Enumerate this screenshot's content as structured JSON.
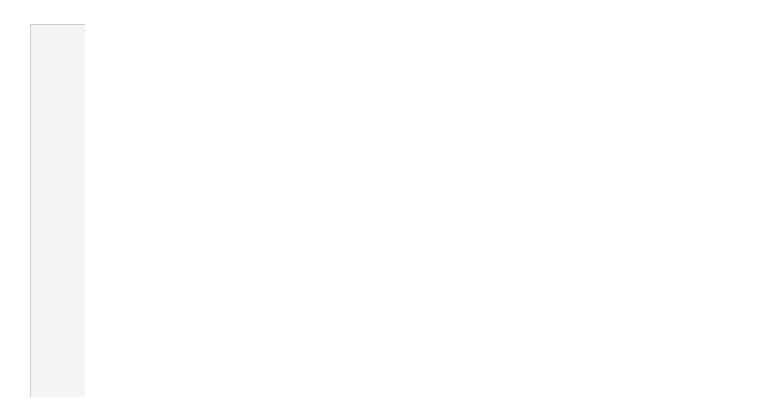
{
  "viewer": {
    "type": "EEG montage display",
    "trace_color": "#6e6e6e",
    "grid_color": "#e2e2e2",
    "axis_color": "#9a9a9a",
    "panel_bg": "#f4f4f4"
  },
  "channels": [
    {
      "label": "Fp1-A1",
      "scale": "50uV",
      "amp": 5.5
    },
    {
      "label": "Fp2-A2",
      "scale": "50uV",
      "amp": 5.0
    },
    {
      "label": "F7-A1",
      "scale": "50uV",
      "amp": 4.5
    },
    {
      "label": "F8-A2",
      "scale": "50uV",
      "amp": 4.0
    },
    {
      "label": "T7-A1",
      "scale": "50uV",
      "amp": 3.0
    },
    {
      "label": "T8-A2",
      "scale": "50uV",
      "amp": 3.0
    },
    {
      "label": "P7-A1",
      "scale": "50uV",
      "amp": 2.5
    },
    {
      "label": "P8-A2",
      "scale": "50uV",
      "amp": 1.5
    },
    {
      "label": "F3-A1",
      "scale": "50uV",
      "amp": 6.0
    },
    {
      "label": "F4-A2",
      "scale": "50uV",
      "amp": 4.5
    },
    {
      "label": "C3-A1",
      "scale": "50uV",
      "amp": 5.5
    },
    {
      "label": "C4-A2",
      "scale": "50uV",
      "amp": 4.0
    },
    {
      "label": "P3-A1",
      "scale": "50uV",
      "amp": 5.0
    },
    {
      "label": "P4-A2",
      "scale": "50uV",
      "amp": 4.0
    },
    {
      "label": "O1-A1",
      "scale": "50uV",
      "amp": 5.0
    },
    {
      "label": "O2-A2",
      "scale": "50uV",
      "amp": 4.5
    }
  ],
  "ecg": {
    "label": "X1-X2",
    "scale": "100uV",
    "heart_rate": "59bpm"
  },
  "time_axis": {
    "seconds_shown": 15,
    "px_per_second": 43.6,
    "minor_ticks_per_second": 5
  }
}
